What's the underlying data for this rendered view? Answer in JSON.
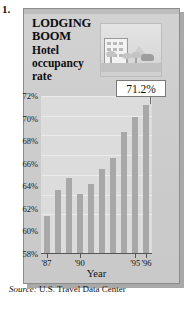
{
  "figure_number": "1.",
  "title": {
    "line1": "LODGING",
    "line2": "BOOM",
    "line3": "Hotel",
    "line4": "occupancy",
    "line5": "rate"
  },
  "callout": {
    "value": "71.2%"
  },
  "source": {
    "prefix": "Source:",
    "text": "U.S. Travel Data Center"
  },
  "colors": {
    "panel": "#cfcfcf",
    "plot": "#dcdcdc",
    "bar": "#a8a8a8",
    "callout_bg": "#ffffff",
    "axis": "#555555"
  },
  "illustration": {
    "name": "hotel-street-scene",
    "building": "hotel-building",
    "vehicle": "car",
    "trees": "palm-trees"
  },
  "chart_data": {
    "type": "bar",
    "title": "Hotel occupancy rate",
    "xlabel": "Year",
    "ylabel": "",
    "ylim": [
      58,
      72
    ],
    "yticks": [
      58,
      60,
      62,
      64,
      66,
      68,
      70,
      72
    ],
    "ytick_labels": [
      "58%",
      "60%",
      "62%",
      "64%",
      "66%",
      "68%",
      "70%",
      "72%"
    ],
    "grid": true,
    "legend": false,
    "categories": [
      "'87",
      "'88",
      "'89",
      "'90",
      "'91",
      "'92",
      "'93",
      "'94",
      "'95",
      "'96"
    ],
    "xtick_labels": [
      "'87",
      "'90",
      "'95",
      "'96"
    ],
    "xtick_indices": [
      0,
      3,
      8,
      9
    ],
    "values": [
      61.4,
      63.7,
      64.7,
      63.3,
      64.2,
      65.5,
      66.5,
      68.8,
      70.1,
      71.2
    ],
    "annotations": [
      {
        "label": "71.2%",
        "category": "'96",
        "value": 71.2
      }
    ]
  }
}
